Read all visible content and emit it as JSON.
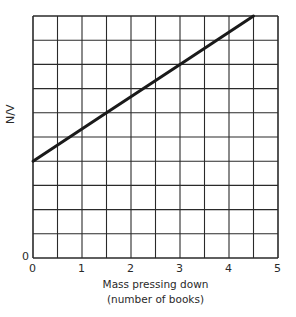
{
  "chart_data": {
    "type": "line",
    "title": "",
    "xlabel_line1": "Mass pressing down",
    "xlabel_line2": "(number of books)",
    "ylabel": "N/V",
    "x_ticks": [
      "0",
      "1",
      "2",
      "3",
      "4",
      "5"
    ],
    "y_ticks": [
      "0"
    ],
    "xlim": [
      0,
      5
    ],
    "ylim": [
      0,
      10
    ],
    "grid": true,
    "grid_x_step": 0.5,
    "grid_y_rows": 10,
    "series": [
      {
        "name": "N/V",
        "x": [
          0,
          1.5,
          3,
          4.5
        ],
        "y": [
          4,
          6,
          8,
          10
        ],
        "color": "#1a1a1a"
      }
    ],
    "legend": null
  },
  "colors": {
    "grid": "#2a2a2a",
    "line": "#1a1a1a",
    "background": "#ffffff"
  }
}
